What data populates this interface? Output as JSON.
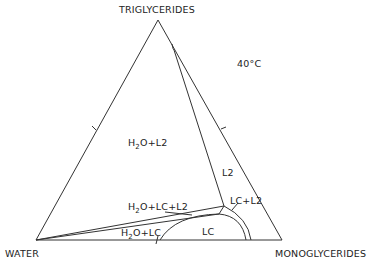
{
  "diagram": {
    "type": "ternary-phase-diagram",
    "temperature": "40°C",
    "vertices": {
      "top": "TRIGLYCERIDES",
      "bottom_left": "WATER",
      "bottom_right": "MONOGLYCERIDES"
    },
    "regions": {
      "h2o_l2": {
        "prefix": "H",
        "sub": "2",
        "suffix": "O+L2"
      },
      "l2": "L2",
      "lc_l2": "LC+L2",
      "h2o_lc_l2": {
        "prefix": "H",
        "sub": "2",
        "suffix": "O+LC+L2"
      },
      "h2o_lc": {
        "prefix": "H",
        "sub": "2",
        "suffix": "O+LC"
      },
      "lc": "LC"
    }
  }
}
